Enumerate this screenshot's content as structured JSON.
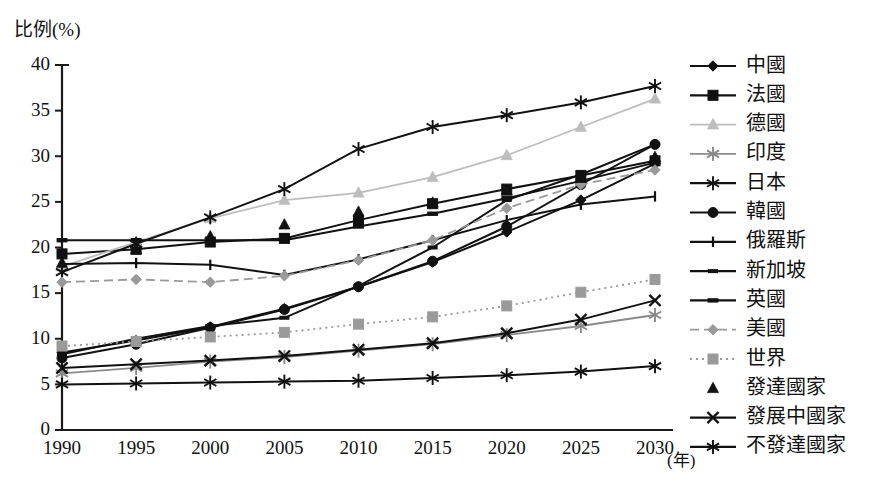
{
  "axes": {
    "y_title": "比例(%)",
    "x_unit": "(年)",
    "y_ticks": [
      "0",
      "5",
      "10",
      "15",
      "20",
      "25",
      "30",
      "35",
      "40"
    ],
    "x_ticks": [
      "1990",
      "1995",
      "2000",
      "2005",
      "2010",
      "2015",
      "2020",
      "2025",
      "2030"
    ]
  },
  "legend": {
    "items": [
      {
        "label": "中國",
        "marker": "diamond",
        "color": "#111111",
        "line": "solid",
        "has_line": true
      },
      {
        "label": "法國",
        "marker": "square",
        "color": "#111111",
        "line": "solid",
        "has_line": true
      },
      {
        "label": "德國",
        "marker": "triangle",
        "color": "#bdbdbd",
        "line": "solid",
        "has_line": true
      },
      {
        "label": "印度",
        "marker": "asterisk",
        "color": "#8a8a8a",
        "line": "solid",
        "has_line": true
      },
      {
        "label": "日本",
        "marker": "asterisk",
        "color": "#111111",
        "line": "solid",
        "has_line": true
      },
      {
        "label": "韓國",
        "marker": "circle",
        "color": "#111111",
        "line": "solid",
        "has_line": true
      },
      {
        "label": "俄羅斯",
        "marker": "plus",
        "color": "#111111",
        "line": "solid",
        "has_line": true
      },
      {
        "label": "新加坡",
        "marker": "dash",
        "color": "#111111",
        "line": "solid",
        "has_line": true
      },
      {
        "label": "英國",
        "marker": "bar",
        "color": "#111111",
        "line": "solid",
        "has_line": true
      },
      {
        "label": "美國",
        "marker": "diamond",
        "color": "#9a9a9a",
        "line": "dashed",
        "has_line": true
      },
      {
        "label": "世界",
        "marker": "square",
        "color": "#9a9a9a",
        "line": "dotted",
        "has_line": true
      },
      {
        "label": "發達國家",
        "marker": "triangle",
        "color": "#111111",
        "line": "none",
        "has_line": false
      },
      {
        "label": "發展中國家",
        "marker": "cross",
        "color": "#111111",
        "line": "solid",
        "has_line": true
      },
      {
        "label": "不發達國家",
        "marker": "asterisk",
        "color": "#111111",
        "line": "solid",
        "has_line": true
      }
    ]
  },
  "chart_data": {
    "type": "line",
    "title": "",
    "subtitle": "",
    "xlabel": "(年)",
    "ylabel": "比例(%)",
    "xlim": [
      1990,
      2030
    ],
    "ylim": [
      0,
      40
    ],
    "grid": false,
    "legend_position": "right",
    "x": [
      1990,
      1995,
      2000,
      2005,
      2010,
      2015,
      2020,
      2025,
      2030
    ],
    "categories": [
      "1990",
      "1995",
      "2000",
      "2005",
      "2010",
      "2015",
      "2020",
      "2025",
      "2030"
    ],
    "series": [
      {
        "name": "中國",
        "values": [
          8.5,
          9.8,
          11.3,
          13.3,
          15.7,
          18.4,
          21.7,
          25.2,
          29.2
        ]
      },
      {
        "name": "法國",
        "values": [
          19.3,
          19.8,
          20.6,
          21.0,
          23.0,
          24.8,
          26.4,
          27.9,
          29.5
        ]
      },
      {
        "name": "德國",
        "values": [
          17.9,
          20.6,
          23.2,
          25.2,
          26.0,
          27.7,
          30.1,
          33.2,
          36.3
        ]
      },
      {
        "name": "印度",
        "values": [
          6.2,
          6.8,
          7.5,
          8.0,
          8.7,
          9.4,
          10.4,
          11.4,
          12.6
        ]
      },
      {
        "name": "日本",
        "values": [
          17.3,
          20.4,
          23.3,
          26.4,
          30.8,
          33.2,
          34.5,
          35.9,
          37.7
        ]
      },
      {
        "name": "韓國",
        "values": [
          7.9,
          9.4,
          11.2,
          13.2,
          15.7,
          18.5,
          22.3,
          26.9,
          31.3
        ]
      },
      {
        "name": "俄羅斯",
        "values": [
          18.2,
          18.3,
          18.1,
          17.0,
          18.7,
          20.8,
          23.0,
          24.7,
          25.6
        ]
      },
      {
        "name": "新加坡",
        "values": [
          8.3,
          10.0,
          11.4,
          12.3,
          15.8,
          20.0,
          25.2,
          28.0,
          31.3
        ]
      },
      {
        "name": "英國",
        "values": [
          20.8,
          20.8,
          20.8,
          20.8,
          22.3,
          23.7,
          25.4,
          27.3,
          29.3
        ]
      },
      {
        "name": "美國",
        "values": [
          16.2,
          16.5,
          16.2,
          16.9,
          18.6,
          20.8,
          24.3,
          26.9,
          28.5
        ]
      },
      {
        "name": "世界",
        "values": [
          9.2,
          9.7,
          10.2,
          10.7,
          11.6,
          12.4,
          13.6,
          15.1,
          16.5
        ]
      },
      {
        "name": "發達國家",
        "values": [
          18.3,
          19.8,
          21.2,
          22.5,
          23.9,
          24.9,
          26.2,
          27.6,
          29.9
        ]
      },
      {
        "name": "發展中國家",
        "values": [
          6.8,
          7.2,
          7.6,
          8.1,
          8.8,
          9.5,
          10.6,
          12.1,
          14.2
        ]
      },
      {
        "name": "不發達國家",
        "values": [
          5.0,
          5.1,
          5.2,
          5.3,
          5.4,
          5.7,
          6.0,
          6.4,
          7.0
        ]
      }
    ]
  }
}
